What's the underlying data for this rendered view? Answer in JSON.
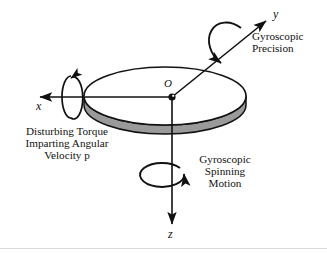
{
  "figure": {
    "background_color": "#ffffff",
    "ink_color": "#111111",
    "rim_color": "#9a9a9a",
    "width": 327,
    "height": 253
  },
  "axes": {
    "x": {
      "label": "x",
      "direction": "left",
      "tip": [
        36,
        97
      ],
      "origin": [
        172,
        97
      ]
    },
    "y": {
      "label": "y",
      "direction": "up-right",
      "tip": [
        270,
        18
      ],
      "origin": [
        172,
        97
      ]
    },
    "z": {
      "label": "z",
      "direction": "down",
      "tip": [
        172,
        228
      ],
      "origin": [
        172,
        97
      ]
    }
  },
  "origin": {
    "label": "O",
    "position": [
      172,
      97
    ]
  },
  "disk": {
    "center": [
      165,
      96
    ],
    "radius_x": 81,
    "radius_y": 29,
    "thickness": 9,
    "face_color": "#ffffff",
    "edge_color": "#9a9a9a"
  },
  "annotations": [
    {
      "name": "gyroscopic-precision",
      "lines": [
        "Gyroscopic",
        "Precision"
      ],
      "text": "Gyroscopic\nPrecision",
      "position": [
        252,
        36
      ],
      "align": "left",
      "attached_to": "y-axis"
    },
    {
      "name": "disturbing-torque",
      "lines": [
        "Disturbing Torque",
        "Imparting Angular",
        "Velocity p"
      ],
      "text": "Disturbing Torque\nImparting Angular\nVelocity p",
      "position": [
        8,
        128
      ],
      "align": "center",
      "attached_to": "x-axis"
    },
    {
      "name": "gyroscopic-spinning-motion",
      "lines": [
        "Gyroscopic",
        "Spinning",
        "Motion"
      ],
      "text": "Gyroscopic\nSpinning\nMotion",
      "position": [
        190,
        156
      ],
      "align": "center",
      "attached_to": "z-axis"
    }
  ],
  "rotation_arrows": [
    {
      "name": "x-axis-rotation-arrow",
      "about_axis": "x",
      "center": [
        69,
        97
      ],
      "sense": "counter-clockwise"
    },
    {
      "name": "y-axis-precession-arrow",
      "about_axis": "y",
      "center": [
        229,
        48
      ],
      "sense": "counter-clockwise"
    },
    {
      "name": "z-axis-spin-arrow",
      "about_axis": "z",
      "center": [
        172,
        178
      ],
      "sense": "clockwise"
    }
  ]
}
